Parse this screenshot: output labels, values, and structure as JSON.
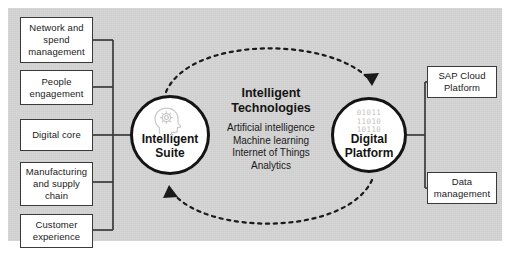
{
  "diagram": {
    "title_center": "Intelligent Technologies",
    "background_color": "#d4d4d4",
    "line_color": "#3a3a3a",
    "binary_color": "#c2c2c2"
  },
  "left_boxes": [
    {
      "label": "Network and spend management"
    },
    {
      "label": "People engagement"
    },
    {
      "label": "Digital core"
    },
    {
      "label": "Manufacturing and supply chain"
    },
    {
      "label": "Customer experience"
    }
  ],
  "right_boxes": [
    {
      "label": "SAP Cloud Platform"
    },
    {
      "label": "Data management"
    }
  ],
  "suite_circle": {
    "line1": "Intelligent",
    "line2": "Suite",
    "icon": "head-gear-icon"
  },
  "platform_circle": {
    "line1": "Digital",
    "line2": "Platform",
    "binary": [
      "01011",
      "11010",
      "10110"
    ]
  },
  "center": {
    "heading_line1": "Intelligent",
    "heading_line2": "Technologies",
    "items": [
      "Artificial intelligence",
      "Machine learning",
      "Internet of Things",
      "Analytics"
    ]
  }
}
